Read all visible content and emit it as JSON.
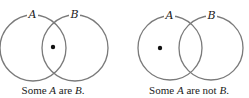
{
  "diagrams": [
    {
      "id": "left",
      "circles": [
        {
          "label": "A",
          "cx": 33,
          "cy": 48,
          "r": 33
        },
        {
          "label": "B",
          "cx": 75,
          "cy": 48,
          "r": 33
        }
      ],
      "dot": {
        "cx": 53,
        "cy": 47,
        "region": "A and B"
      },
      "caption": {
        "pre": "Some ",
        "a": "A",
        "mid": " are ",
        "b": "B",
        "post": "."
      }
    },
    {
      "id": "right",
      "circles": [
        {
          "label": "A",
          "cx": 170,
          "cy": 48,
          "r": 32
        },
        {
          "label": "B",
          "cx": 211,
          "cy": 48,
          "r": 32
        }
      ],
      "dot": {
        "cx": 160,
        "cy": 48,
        "region": "A only"
      },
      "caption": {
        "pre": "Some ",
        "a": "A",
        "mid": " are not ",
        "b": "B",
        "post": "."
      }
    }
  ],
  "colors": {
    "circle_stroke": "#7a7a7a",
    "dot": "#111111",
    "text": "#222222"
  }
}
